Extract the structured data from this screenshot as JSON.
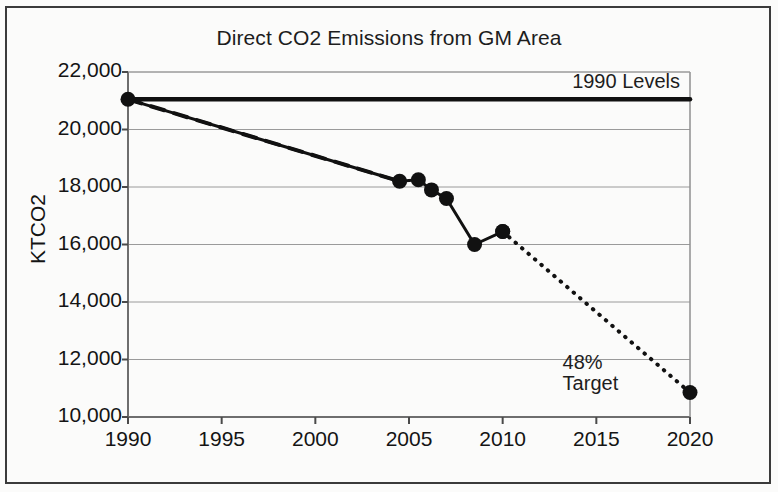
{
  "figure": {
    "title": "Direct CO2 Emissions from GM Area",
    "border_color": "#3b3b3b",
    "background": "#fbfbfa"
  },
  "annotations": {
    "baseline_label": "1990 Levels",
    "target_label_line1": "48%",
    "target_label_line2": "Target"
  },
  "chart_data": {
    "type": "line",
    "title": "Direct CO2 Emissions from GM Area",
    "xlabel": "",
    "ylabel": "KTCO2",
    "xlim": [
      1990,
      2020
    ],
    "ylim": [
      10000,
      22000
    ],
    "grid": true,
    "legend": "none",
    "xticks": [
      1990,
      1995,
      2000,
      2005,
      2010,
      2015,
      2020
    ],
    "xtick_labels": [
      "1990",
      "1995",
      "2000",
      "2005",
      "2010",
      "2015",
      "2020"
    ],
    "yticks": [
      10000,
      12000,
      14000,
      16000,
      18000,
      20000,
      22000
    ],
    "ytick_labels": [
      "10,000",
      "12,000",
      "14,000",
      "16,000",
      "18,000",
      "20,000",
      "22,000"
    ],
    "series": [
      {
        "name": "1990 Levels baseline",
        "style": "solid-thick",
        "color": "#111111",
        "markers": false,
        "x": [
          1990,
          2020
        ],
        "values": [
          21050,
          21050
        ]
      },
      {
        "name": "Trajectory to 2004 (interpolated)",
        "style": "dashed",
        "color": "#111111",
        "markers": false,
        "x": [
          1990,
          2004.5
        ],
        "values": [
          21050,
          18200
        ]
      },
      {
        "name": "Measured emissions",
        "style": "solid",
        "color": "#111111",
        "markers": true,
        "x": [
          1990,
          2004.5,
          2005.5,
          2006.2,
          2007.0,
          2008.5,
          2010.0
        ],
        "values": [
          21050,
          18200,
          18250,
          17900,
          17600,
          16000,
          16450
        ]
      },
      {
        "name": "Projection to 48% target",
        "style": "dotted",
        "color": "#111111",
        "markers": true,
        "x": [
          2010.0,
          2020
        ],
        "values": [
          16450,
          10850
        ]
      }
    ],
    "annotations": [
      {
        "text": "1990 Levels",
        "x": 2018.5,
        "y": 21400
      },
      {
        "text": "48% Target",
        "x": 2014.2,
        "y": 11600
      }
    ]
  }
}
